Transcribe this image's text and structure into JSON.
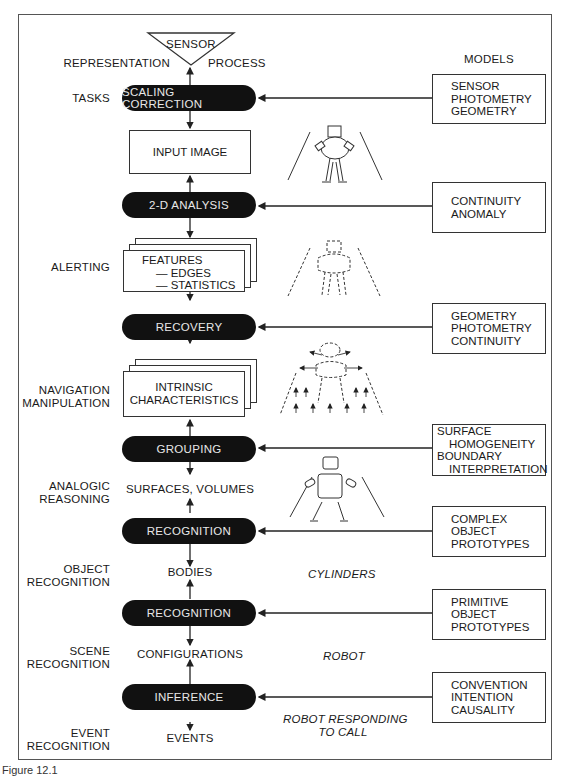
{
  "figure": {
    "caption": "Figure 12.1",
    "sensor": "SENSOR",
    "representation_header": "REPRESENTATION",
    "process_header": "PROCESS",
    "models_header": "MODELS"
  },
  "tasks": [
    {
      "lines": [
        "TASKS"
      ]
    },
    {
      "lines": [
        "ALERTING"
      ]
    },
    {
      "lines": [
        "NAVIGATION",
        "MANIPULATION"
      ]
    },
    {
      "lines": [
        "ANALOGIC",
        "REASONING"
      ]
    },
    {
      "lines": [
        "OBJECT",
        "RECOGNITION"
      ]
    },
    {
      "lines": [
        "SCENE",
        "RECOGNITION"
      ]
    },
    {
      "lines": [
        "EVENT",
        "RECOGNITION"
      ]
    }
  ],
  "processes": [
    {
      "label": "SCALING CORRECTION"
    },
    {
      "label": "2-D ANALYSIS"
    },
    {
      "label": "RECOVERY"
    },
    {
      "label": "GROUPING"
    },
    {
      "label": "RECOGNITION"
    },
    {
      "label": "RECOGNITION"
    },
    {
      "label": "INFERENCE"
    }
  ],
  "representations": {
    "input_image": "INPUT IMAGE",
    "features": {
      "title": "FEATURES",
      "items": [
        "— EDGES",
        "— STATISTICS"
      ]
    },
    "intrinsic": [
      "INTRINSIC",
      "CHARACTERISTICS"
    ],
    "surfaces": "SURFACES, VOLUMES",
    "bodies": "BODIES",
    "configurations": "CONFIGURATIONS",
    "events": "EVENTS"
  },
  "models": [
    {
      "lines": [
        "SENSOR",
        "PHOTOMETRY",
        "GEOMETRY"
      ]
    },
    {
      "lines": [
        "CONTINUITY",
        "ANOMALY"
      ]
    },
    {
      "lines": [
        "GEOMETRY",
        "PHOTOMETRY",
        "CONTINUITY"
      ]
    },
    {
      "lines": [
        "SURFACE",
        "HOMOGENEITY",
        "BOUNDARY",
        "INTERPRETATION"
      ]
    },
    {
      "lines": [
        "COMPLEX",
        "OBJECT",
        "PROTOTYPES"
      ]
    },
    {
      "lines": [
        "PRIMITIVE",
        "OBJECT",
        "PROTOTYPES"
      ]
    },
    {
      "lines": [
        "CONVENTION",
        "INTENTION",
        "CAUSALITY"
      ]
    }
  ],
  "examples": {
    "cylinders": "CYLINDERS",
    "robot": "ROBOT",
    "robot_call": [
      "ROBOT RESPONDING",
      "TO CALL"
    ]
  },
  "illustrations": [
    {
      "name": "robot-image-icon"
    },
    {
      "name": "robot-edges-icon"
    },
    {
      "name": "robot-intrinsic-icon"
    },
    {
      "name": "robot-cylinders-icon"
    }
  ]
}
